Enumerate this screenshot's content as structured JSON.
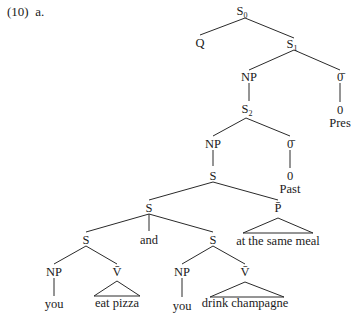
{
  "example": {
    "number": "(10)",
    "letter": "a."
  },
  "colors": {
    "ink": "#1a1a1a",
    "background": "#ffffff"
  },
  "nodes": {
    "s0": {
      "label": "S",
      "sub": "0"
    },
    "q": {
      "label": "Q"
    },
    "s1": {
      "label": "S",
      "sub": "1"
    },
    "np1": {
      "label": "NP"
    },
    "obar1": {
      "label": "0̄"
    },
    "zero1": {
      "label": "0"
    },
    "pres": {
      "label": "Pres"
    },
    "s2": {
      "label": "S",
      "sub": "2"
    },
    "np2": {
      "label": "NP"
    },
    "obar2": {
      "label": "0̄"
    },
    "zero2": {
      "label": "0"
    },
    "past": {
      "label": "Past"
    },
    "s3": {
      "label": "S"
    },
    "s_conj": {
      "label": "S"
    },
    "pbar": {
      "label": "P̄"
    },
    "pp_text": {
      "label": "at the same meal"
    },
    "s_left": {
      "label": "S"
    },
    "and": {
      "label": "and"
    },
    "s_right": {
      "label": "S"
    },
    "np_left": {
      "label": "NP"
    },
    "vbar_left": {
      "label": "V̄"
    },
    "you_left": {
      "label": "you"
    },
    "vp_left_text": {
      "label": "eat pizza"
    },
    "np_right": {
      "label": "NP"
    },
    "vbar_right": {
      "label": "V̄"
    },
    "you_right": {
      "label": "you"
    },
    "vp_right_text": {
      "label": "drink champagne"
    }
  }
}
